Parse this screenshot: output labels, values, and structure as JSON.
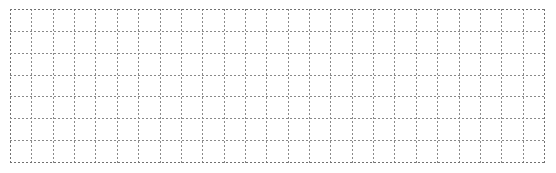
{
  "canvas": {
    "width": 556,
    "height": 173,
    "background_color": "#ffffff",
    "content_text": "",
    "description": "Empty dashed grid sheet"
  },
  "grid": {
    "name": "dashed-grid-sheet",
    "origin_x": 10,
    "origin_y": 9,
    "width": 535,
    "height": 154,
    "columns": 25,
    "rows": 7,
    "column_width": 21.4,
    "row_height": 22,
    "vertical_line_count": 26,
    "horizontal_line_count": 8,
    "line_color": "#8a8a8a",
    "line_style": "dashed",
    "line_width": 1,
    "dash_on": 2,
    "dash_off": 2,
    "cell_fill": "#ffffff",
    "cell_count": 175,
    "label": ""
  }
}
